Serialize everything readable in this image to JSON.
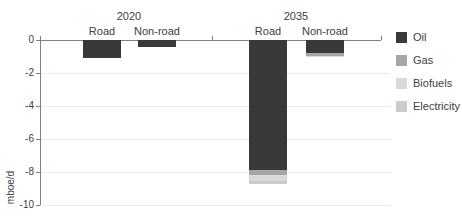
{
  "chart_data": {
    "type": "bar",
    "stacked": true,
    "title": "",
    "xlabel": "",
    "ylabel": "mboe/d",
    "ylim": [
      -10,
      0
    ],
    "yticks": [
      0,
      -2,
      -4,
      -6,
      -8,
      -10
    ],
    "grid": "horizontal light gray lines at each y tick",
    "legend_position": "right",
    "group_labels": [
      "2020",
      "2035"
    ],
    "categories": [
      "Road",
      "Non-road",
      "Road",
      "Non-road"
    ],
    "category_group_index": [
      0,
      0,
      1,
      1
    ],
    "series": [
      {
        "name": "Oil",
        "color": "#3a3838",
        "values": [
          -1.1,
          -0.45,
          -7.9,
          -0.8
        ]
      },
      {
        "name": "Gas",
        "color": "#a6a6a6",
        "values": [
          0,
          0,
          -0.3,
          -0.15
        ]
      },
      {
        "name": "Biofuels",
        "color": "#d9d9d9",
        "values": [
          0,
          0,
          -0.35,
          -0.1
        ]
      },
      {
        "name": "Electricity",
        "color": "#c7cdc7",
        "values": [
          0,
          0,
          -0.2,
          0
        ]
      }
    ],
    "bar_totals": [
      -1.1,
      -0.45,
      -8.75,
      -1.05
    ],
    "axis_color": "#808080",
    "grid_color": "#ebebeb",
    "text_color": "#404040",
    "background": "#ffffff"
  }
}
